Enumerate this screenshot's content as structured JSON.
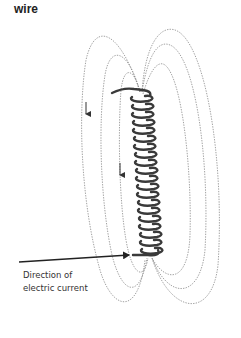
{
  "title": "wire",
  "caption": {
    "line1": "Direction of",
    "line2": "electric current"
  },
  "diagram": {
    "coil_turns": 20,
    "field_lines_left": 3,
    "field_lines_right": 3,
    "field_direction_arrows": [
      "down",
      "down"
    ],
    "current_arrow": "points-right-into-coil-bottom-lead"
  }
}
